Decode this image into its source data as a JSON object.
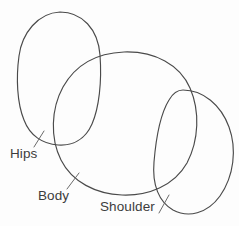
{
  "figure": {
    "kind": "hand-drawn-sketch",
    "title": "",
    "background_color": "#fdfdfd",
    "stroke_color": "#4a4a4a",
    "leader_color": "#6b6b6b",
    "text_color": "#3c3c3c",
    "width": 239,
    "height": 226
  },
  "labels": {
    "hips": "Hips",
    "body": "Body",
    "shoulder": "Shoulder"
  },
  "shapes": [
    {
      "name": "hips-ellipse",
      "label": "Hips",
      "cx": 59,
      "cy": 79,
      "rx": 41,
      "ry": 67,
      "rotation": -4
    },
    {
      "name": "body-ellipse",
      "label": "Body",
      "cx": 124,
      "cy": 123,
      "rx": 72,
      "ry": 72,
      "rotation": 0
    },
    {
      "name": "shoulder-ellipse",
      "label": "Shoulder",
      "cx": 194,
      "cy": 152,
      "rx": 39,
      "ry": 63,
      "rotation": 12
    }
  ],
  "leaders": [
    {
      "name": "hips-leader",
      "from": [
        34,
        147
      ],
      "to": [
        44,
        131
      ]
    },
    {
      "name": "body-leader",
      "from": [
        67,
        189
      ],
      "to": [
        79,
        173
      ]
    },
    {
      "name": "shoulder-leader",
      "from": [
        159,
        213
      ],
      "to": [
        169,
        195
      ]
    }
  ]
}
